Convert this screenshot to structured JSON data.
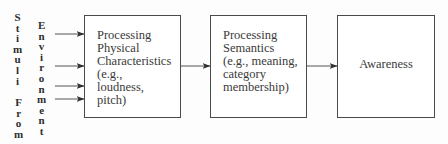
{
  "left_labels": {
    "stimuli": [
      "S",
      "t",
      "i",
      "m",
      "u",
      "l",
      "i"
    ],
    "from": [
      "F",
      "r",
      "o",
      "m"
    ],
    "environment": [
      "E",
      "n",
      "v",
      "i",
      "r",
      "o",
      "n",
      "m",
      "e",
      "n",
      "t"
    ]
  },
  "boxes": [
    {
      "id": "physical",
      "lines": [
        "Processing",
        "Physical",
        "Characteristics",
        "(e.g.,",
        "loudness,",
        "pitch)"
      ]
    },
    {
      "id": "semantics",
      "lines": [
        "Processing",
        "Semantics",
        "(e.g., meaning,",
        "category",
        "membership)"
      ]
    },
    {
      "id": "awareness",
      "label": "Awareness"
    }
  ],
  "colors": {
    "line": "#4a4a4a",
    "text": "#3a3a3a",
    "background": "#fdfdfd"
  }
}
